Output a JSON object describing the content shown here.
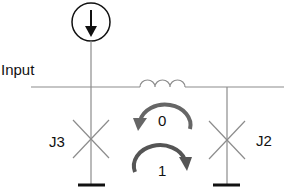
{
  "diagram": {
    "title": "",
    "labels": {
      "input": "Input",
      "j3": "J3",
      "j2": "J2",
      "loop_0": "0",
      "loop_1": "1"
    },
    "components": [
      {
        "id": "current-source",
        "type": "current source",
        "direction": "down"
      },
      {
        "id": "inductor",
        "type": "inductor"
      },
      {
        "id": "J3",
        "type": "Josephson junction"
      },
      {
        "id": "J2",
        "type": "Josephson junction"
      },
      {
        "id": "ground-j3",
        "type": "ground"
      },
      {
        "id": "ground-j2",
        "type": "ground"
      }
    ],
    "loops": [
      {
        "label": "0",
        "direction": "counter-clockwise"
      },
      {
        "label": "1",
        "direction": "clockwise"
      }
    ],
    "colors": {
      "wire": "#8c8c8c",
      "symbol": "#111111",
      "arrow": "#666666"
    }
  }
}
